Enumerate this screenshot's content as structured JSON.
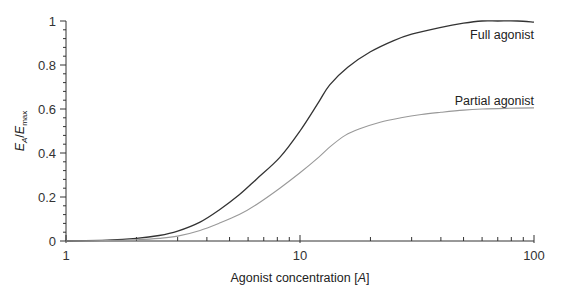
{
  "chart_data": {
    "type": "line",
    "title": "",
    "xlabel": "Agonist concentration [A]",
    "xlabel_parts": {
      "text": "Agonist concentration [",
      "italic": "A",
      "close": "]"
    },
    "ylabel": "E_A/E_max",
    "ylabel_parts": {
      "e1": "E",
      "sub1": "A",
      "slash": "/",
      "e2": "E",
      "sub2": "max"
    },
    "xscale": "log",
    "xlim": [
      1,
      100
    ],
    "ylim": [
      0,
      1
    ],
    "x_ticks": [
      1,
      10,
      100
    ],
    "x_tick_labels": [
      "1",
      "10",
      "100"
    ],
    "x_minor_ticks": [
      2,
      3,
      4,
      5,
      6,
      7,
      8,
      9,
      20,
      30,
      40,
      50,
      60,
      70,
      80,
      90
    ],
    "y_ticks": [
      0,
      0.2,
      0.4,
      0.6,
      0.8,
      1
    ],
    "y_tick_labels": [
      "0",
      "0.2",
      "0.4",
      "0.6",
      "0.8",
      "1"
    ],
    "y_minor_step": 0.04,
    "grid": false,
    "legend": "inline labels at right end of curves",
    "series": [
      {
        "name": "Full agonist",
        "color": "#333333",
        "x": [
          1,
          1.5,
          2,
          2.5,
          3,
          3.74,
          4.5,
          5.5,
          6.5,
          8.2,
          10,
          12,
          13.4,
          16,
          20,
          25,
          30,
          39.6,
          50,
          60,
          70,
          85,
          100
        ],
        "y": [
          0.0,
          0.004,
          0.012,
          0.025,
          0.045,
          0.086,
          0.14,
          0.21,
          0.28,
          0.38,
          0.5,
          0.63,
          0.71,
          0.79,
          0.86,
          0.91,
          0.94,
          0.97,
          0.99,
          1.0,
          1.0,
          1.0,
          0.995
        ]
      },
      {
        "name": "Partial agonist",
        "color": "#999999",
        "x": [
          1,
          1.5,
          2,
          2.5,
          3,
          3.74,
          4.5,
          5.5,
          6.5,
          8.2,
          10,
          12,
          13.5,
          15.6,
          18,
          22,
          27,
          33,
          40,
          50,
          60,
          75,
          100
        ],
        "y": [
          0.0,
          0.002,
          0.006,
          0.012,
          0.022,
          0.048,
          0.08,
          0.12,
          0.165,
          0.24,
          0.31,
          0.38,
          0.43,
          0.48,
          0.51,
          0.54,
          0.56,
          0.575,
          0.585,
          0.595,
          0.6,
          0.603,
          0.605
        ]
      }
    ],
    "annotations": [
      {
        "text": "Full agonist",
        "series": "Full agonist"
      },
      {
        "text": "Partial agonist",
        "series": "Partial agonist"
      }
    ]
  },
  "colors": {
    "axis": "#333333",
    "full": "#333333",
    "partial": "#999999"
  }
}
